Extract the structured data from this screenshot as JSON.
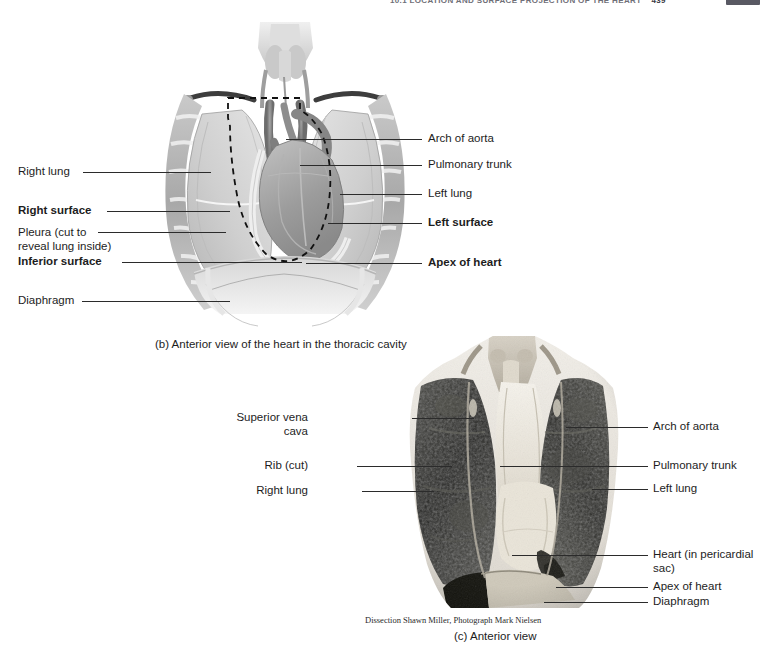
{
  "header": {
    "running_head": "10.1  LOCATION AND SURFACE PROJECTION OF THE HEART",
    "page_number": "439",
    "tab": ""
  },
  "figure_b": {
    "caption": "(b) Anterior view of the heart in the thoracic cavity",
    "labels_left": [
      {
        "text": "Right lung",
        "bold": false
      },
      {
        "text": "Right surface",
        "bold": true
      },
      {
        "text": "Pleura (cut to\nreveal lung inside)",
        "bold": false
      },
      {
        "text": "Inferior surface",
        "bold": true
      },
      {
        "text": "Diaphragm",
        "bold": false
      }
    ],
    "labels_right": [
      {
        "text": "Arch of aorta",
        "bold": false
      },
      {
        "text": "Pulmonary trunk",
        "bold": false
      },
      {
        "text": "Left lung",
        "bold": false
      },
      {
        "text": "Left surface",
        "bold": true
      },
      {
        "text": "Apex of heart",
        "bold": true
      }
    ]
  },
  "figure_c": {
    "caption": "(c) Anterior view",
    "credit": "Dissection Shawn Miller, Photograph Mark Nielsen",
    "labels_left": [
      {
        "text": "Superior vena cava"
      },
      {
        "text": "Rib (cut)"
      },
      {
        "text": "Right lung"
      }
    ],
    "labels_right": [
      {
        "text": "Arch of aorta"
      },
      {
        "text": "Pulmonary trunk"
      },
      {
        "text": "Left lung"
      },
      {
        "text": "Heart (in pericardial\nsac)"
      },
      {
        "text": "Apex of heart"
      },
      {
        "text": "Diaphragm"
      }
    ]
  },
  "colors": {
    "leader_line": "#2b2b2b",
    "text": "#1d1d1d",
    "illustration_light": "#dcdcdc",
    "illustration_mid": "#b4b4b4",
    "illustration_dark": "#6e6e6e",
    "photo_dark": "#2c2c2c",
    "photo_light": "#e8e4dc"
  }
}
